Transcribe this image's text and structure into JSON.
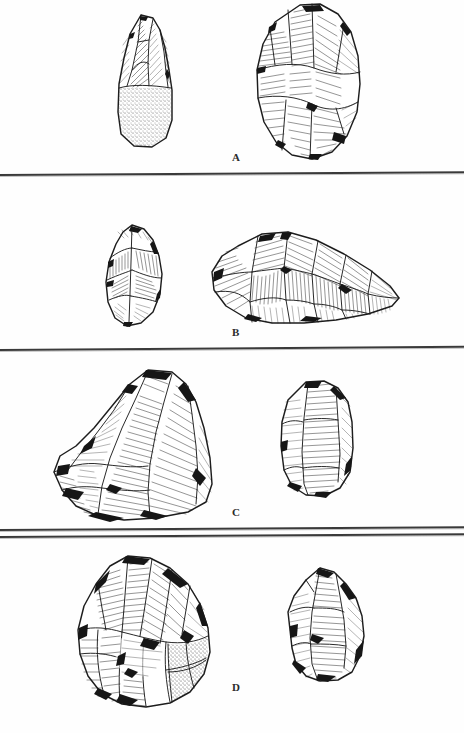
{
  "figure": {
    "kind": "archaeological-lithic-plate",
    "medium": "pen-and-ink line drawing, scanned",
    "background_color": "#ffffff",
    "ink_color": "#1d1d1d",
    "rule_color": "#3a3a3a",
    "width_px": 464,
    "height_px": 733,
    "panel_count": 4,
    "artifact_count": 8
  },
  "panels": [
    {
      "id": "panel-a",
      "label": "A",
      "label_x": 236,
      "label_y": 158,
      "rule_y": 174,
      "artifacts": [
        {
          "name": "artifact-a-left",
          "description": "elongated pointed core/handaxe with stippled cortex at base",
          "x": 108,
          "y": 12,
          "w": 74,
          "h": 140,
          "has_cortex_stipple": true,
          "orientation": "vertical"
        },
        {
          "name": "artifact-a-right",
          "description": "large ovate biface with multidirectional flake scars",
          "x": 248,
          "y": 2,
          "w": 118,
          "h": 162,
          "has_cortex_stipple": false,
          "orientation": "vertical"
        }
      ]
    },
    {
      "id": "panel-b",
      "label": "B",
      "label_x": 236,
      "label_y": 333,
      "rule_y": 349,
      "artifacts": [
        {
          "name": "artifact-b-left",
          "description": "small teardrop-shaped bifacial point",
          "x": 98,
          "y": 222,
          "w": 72,
          "h": 108,
          "has_cortex_stipple": false,
          "orientation": "vertical"
        },
        {
          "name": "artifact-b-right",
          "description": "large elongated wedge-shaped core, flaked along the long axis",
          "x": 196,
          "y": 228,
          "w": 210,
          "h": 106,
          "has_cortex_stipple": false,
          "orientation": "horizontal"
        }
      ]
    },
    {
      "id": "panel-c",
      "label": "C",
      "label_x": 236,
      "label_y": 513,
      "rule_y": 529,
      "artifacts": [
        {
          "name": "artifact-c-left",
          "description": "large angular flake / chopper with deep parallel hatched facet",
          "x": 40,
          "y": 366,
          "w": 178,
          "h": 158,
          "has_cortex_stipple": false,
          "orientation": "diagonal"
        },
        {
          "name": "artifact-c-right",
          "description": "sub-rectangular core with broad hatched dorsal face",
          "x": 272,
          "y": 378,
          "w": 88,
          "h": 124,
          "has_cortex_stipple": false,
          "orientation": "vertical"
        }
      ]
    },
    {
      "id": "panel-d",
      "label": "D",
      "label_x": 236,
      "label_y": 688,
      "rule_y": null,
      "artifacts": [
        {
          "name": "artifact-d-left",
          "description": "large rounded polyhedral core with stippled cortex patch at lower right",
          "x": 68,
          "y": 552,
          "w": 150,
          "h": 158,
          "has_cortex_stipple": true,
          "orientation": "vertical"
        },
        {
          "name": "artifact-d-right",
          "description": "smaller pointed core with banded hatching",
          "x": 278,
          "y": 564,
          "w": 94,
          "h": 122,
          "has_cortex_stipple": false,
          "orientation": "vertical"
        }
      ]
    }
  ],
  "rules": [
    {
      "name": "rule-after-a",
      "y": 174,
      "tilt_deg": -0.35
    },
    {
      "name": "rule-after-b",
      "y": 349,
      "tilt_deg": -0.4
    },
    {
      "name": "rule-after-c",
      "y": 529,
      "tilt_deg": -0.35
    },
    {
      "name": "rule-before-d",
      "y": 535,
      "tilt_deg": -0.35
    }
  ]
}
